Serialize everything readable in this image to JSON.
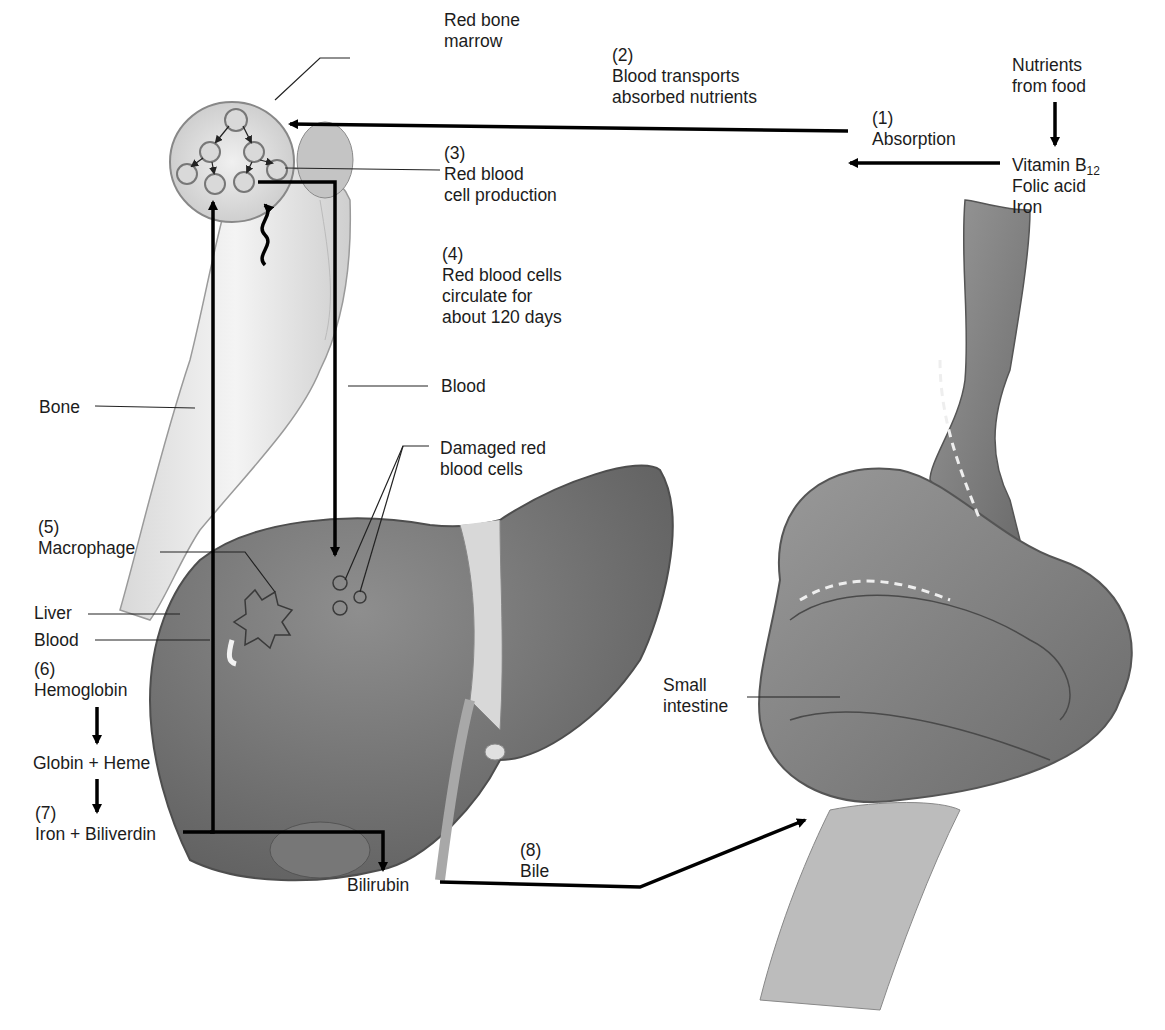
{
  "figure": {
    "colors": {
      "background": "#ffffff",
      "text": "#1c1c1c",
      "arrow": "#000000",
      "organ_dark": "#6e6e6e",
      "organ_mid": "#8a8a8a",
      "bone": "#e8e8e8"
    }
  },
  "labels": {
    "red_bone_marrow": [
      "Red bone",
      "marrow"
    ],
    "step2": {
      "num": "(2)",
      "lines": [
        "Blood transports",
        "absorbed nutrients"
      ]
    },
    "nutrients": [
      "Nutrients",
      "from food"
    ],
    "step1": {
      "num": "(1)",
      "lines": [
        "Absorption"
      ]
    },
    "vitamins": {
      "vitamin": "Vitamin B",
      "sub": "12",
      "folic": "Folic acid",
      "iron": "Iron"
    },
    "step3": {
      "num": "(3)",
      "lines": [
        "Red blood",
        "cell production"
      ]
    },
    "step4": {
      "num": "(4)",
      "lines": [
        "Red blood cells",
        "circulate for",
        "about 120 days"
      ]
    },
    "blood_top": "Blood",
    "bone": "Bone",
    "damaged": [
      "Damaged red",
      "blood cells"
    ],
    "step5": {
      "num": "(5)",
      "lines": [
        "Macrophage"
      ]
    },
    "liver": "Liver",
    "blood_left": "Blood",
    "step6": {
      "num": "(6)",
      "lines": [
        "Hemoglobin"
      ]
    },
    "globin_heme": "Globin + Heme",
    "step7": {
      "num": "(7)",
      "lines": [
        "Iron + Biliverdin"
      ]
    },
    "bilirubin": "Bilirubin",
    "step8": {
      "num": "(8)",
      "lines": [
        "Bile"
      ]
    },
    "small_intestine": [
      "Small",
      "intestine"
    ]
  }
}
